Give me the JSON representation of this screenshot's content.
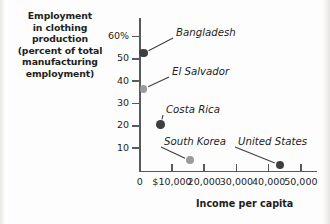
{
  "chart_data": {
    "type": "scatter",
    "title": "",
    "ylabel": "Employment in clothing production (percent of total manufacturing employment)",
    "xlabel": "Income per capita",
    "xlim": [
      0,
      55000
    ],
    "ylim": [
      0,
      62
    ],
    "grid": false,
    "legend": "none",
    "y_tick_labels": [
      "60%",
      "50",
      "40",
      "30",
      "20",
      "10"
    ],
    "y_tick_values": [
      60,
      50,
      40,
      30,
      20,
      10
    ],
    "x_tick_labels": [
      "$10,000",
      "20,000",
      "30,000",
      "40,000",
      "50,000"
    ],
    "x_tick_values": [
      10000,
      20000,
      30000,
      40000,
      50000
    ],
    "x_origin_label": "0",
    "points": [
      {
        "name": "Bangladesh",
        "x": 1200,
        "y": 52.5,
        "marker": "dark",
        "size": 8.5
      },
      {
        "name": "El Salvador",
        "x": 1200,
        "y": 36.5,
        "marker": "light",
        "size": 7.5
      },
      {
        "name": "Costa Rica",
        "x": 6500,
        "y": 20.5,
        "marker": "dark",
        "size": 8.5
      },
      {
        "name": "South Korea",
        "x": 15500,
        "y": 4.5,
        "marker": "light",
        "size": 8.0
      },
      {
        "name": "United States",
        "x": 43500,
        "y": 2.5,
        "marker": "dark",
        "size": 8.5
      }
    ]
  },
  "y_axis_title": {
    "line1": "Employment",
    "line2": "in clothing",
    "line3": "production",
    "line4": "(percent of total",
    "line5": "manufacturing",
    "line6": "employment)"
  },
  "x_axis_title": "Income per capita"
}
